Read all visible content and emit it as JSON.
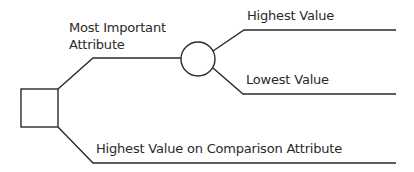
{
  "diagram": {
    "type": "decision-tree",
    "colors": {
      "stroke": "#2a2a2a",
      "text": "#2a2a2a",
      "background": "#ffffff"
    },
    "nodes": {
      "decision": {
        "shape": "square",
        "label": ""
      },
      "chance": {
        "shape": "circle",
        "label": ""
      }
    },
    "branches": {
      "most_important": {
        "label_line1": "Most Important",
        "label_line2": "Attribute"
      },
      "highest": {
        "label": "Highest Value"
      },
      "lowest": {
        "label": "Lowest Value"
      },
      "comparison": {
        "label": "Highest Value on Comparison Attribute"
      }
    }
  }
}
